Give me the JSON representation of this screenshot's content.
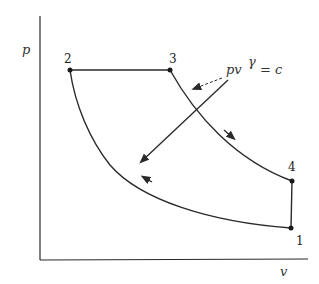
{
  "diagram": {
    "type": "p-v diagram (thermodynamic cycle)",
    "axes": {
      "y_label": "p",
      "x_label": "v"
    },
    "points": [
      {
        "id": "1",
        "label": "1"
      },
      {
        "id": "2",
        "label": "2"
      },
      {
        "id": "3",
        "label": "3"
      },
      {
        "id": "4",
        "label": "4"
      }
    ],
    "processes": [
      {
        "from": "2",
        "to": "3",
        "kind": "constant pressure"
      },
      {
        "from": "3",
        "to": "4",
        "kind": "isentropic expansion"
      },
      {
        "from": "4",
        "to": "1",
        "kind": "constant volume"
      },
      {
        "from": "1",
        "to": "2",
        "kind": "isentropic compression"
      }
    ],
    "annotation": {
      "base": "pv",
      "exponent": "γ",
      "rhs": "= c"
    },
    "colors": {
      "line": "#2a2a2a",
      "background": "#ffffff"
    }
  }
}
